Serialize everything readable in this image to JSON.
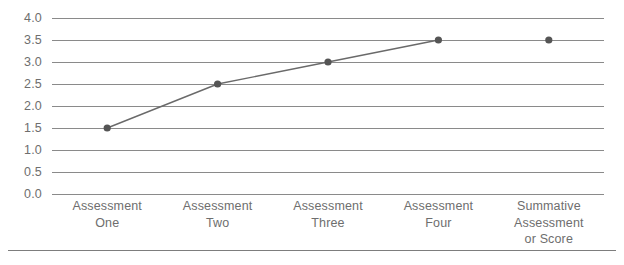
{
  "chart_data": {
    "type": "line",
    "title": "",
    "xlabel": "",
    "ylabel": "",
    "ylim": [
      0.0,
      4.0
    ],
    "ytick_step": 0.5,
    "grid": true,
    "legend": "none",
    "categories": [
      "Assessment\nOne",
      "Assessment\nTwo",
      "Assessment\nThree",
      "Assessment\nFour",
      "Summative\nAssessment\nor Score"
    ],
    "ytick_labels": [
      "4.0",
      "3.5",
      "3.0",
      "2.5",
      "2.0",
      "1.5",
      "1.0",
      "0.5",
      "0.0"
    ],
    "ytick_values": [
      4.0,
      3.5,
      3.0,
      2.5,
      2.0,
      1.5,
      1.0,
      0.5,
      0.0
    ],
    "series": [
      {
        "name": "Assessment progression",
        "values": [
          1.5,
          2.5,
          3.0,
          3.5,
          null
        ],
        "connected": true,
        "line_color": "#6a6a6a",
        "marker_color": "#555555"
      },
      {
        "name": "Summative score",
        "values": [
          null,
          null,
          null,
          null,
          3.5
        ],
        "connected": false,
        "line_color": "#6a6a6a",
        "marker_color": "#555555"
      }
    ],
    "points": [
      {
        "category": "Assessment One",
        "value": 1.5
      },
      {
        "category": "Assessment Two",
        "value": 2.5
      },
      {
        "category": "Assessment Three",
        "value": 3.0
      },
      {
        "category": "Assessment Four",
        "value": 3.5
      },
      {
        "category": "Summative Assessment or Score",
        "value": 3.5
      }
    ],
    "colors": {
      "gridline": "#8a8a8a",
      "line": "#6a6a6a",
      "marker": "#555555",
      "text": "#6e6e6e",
      "rule": "#7d7d7d",
      "background": "#ffffff"
    }
  }
}
